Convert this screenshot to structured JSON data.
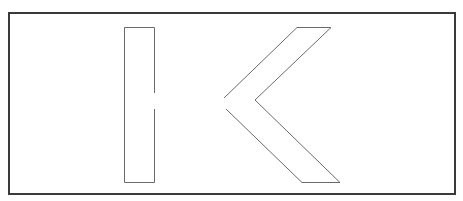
{
  "figure": {
    "letter": "K",
    "colors": {
      "background": "#ffffff",
      "frame_border": "#3a3a3a",
      "stroke": "#6a6a6a"
    },
    "shapes": {
      "stem": {
        "points": "124.5,27.5 154.5,27.5 154.5,93 M154.5,109 154.5,182.5 124.5,182.5 124.5,27.5"
      },
      "upper_arm": {
        "points": "224,98 297,27.5 331,27.5 255,100"
      },
      "lower_arm": {
        "points": "226,109 302,182.5 340,182.5 255,100"
      }
    }
  }
}
